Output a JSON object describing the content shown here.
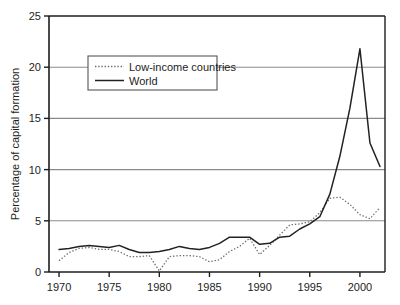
{
  "chart_data": {
    "type": "line",
    "title": "",
    "subtitle": "",
    "xlabel": "",
    "ylabel": "Percentage of capital formation",
    "xlim": [
      1969,
      2002.5
    ],
    "ylim": [
      0,
      25
    ],
    "yticks": [
      0,
      5,
      10,
      15,
      20,
      25
    ],
    "ytick_labels": [
      "0",
      "5",
      "10",
      "15",
      "20",
      "25"
    ],
    "xticks": [
      1970,
      1975,
      1980,
      1985,
      1990,
      1995,
      2000
    ],
    "xtick_labels": [
      "1970",
      "1975",
      "1980",
      "1985",
      "1990",
      "1995",
      "2000"
    ],
    "grid": "horizontal",
    "legend_position": "upper-left-inside",
    "series": [
      {
        "name": "Low-income countries",
        "style": "dotted",
        "color": "#6e6e6e",
        "x": [
          1970,
          1971,
          1972,
          1973,
          1974,
          1975,
          1976,
          1977,
          1978,
          1979,
          1980,
          1981,
          1982,
          1983,
          1984,
          1985,
          1986,
          1987,
          1988,
          1989,
          1990,
          1991,
          1992,
          1993,
          1994,
          1995,
          1996,
          1997,
          1998,
          1999,
          2000,
          2001,
          2002
        ],
        "values": [
          1.1,
          1.9,
          2.3,
          2.4,
          2.2,
          2.2,
          2.0,
          1.5,
          1.5,
          1.6,
          0.1,
          1.5,
          1.6,
          1.6,
          1.5,
          1.0,
          1.2,
          2.0,
          2.5,
          3.3,
          1.7,
          2.6,
          3.6,
          4.6,
          4.7,
          4.9,
          5.8,
          7.2,
          7.3,
          6.6,
          5.6,
          5.2,
          6.3
        ]
      },
      {
        "name": "World",
        "style": "solid",
        "color": "#222222",
        "x": [
          1970,
          1971,
          1972,
          1973,
          1974,
          1975,
          1976,
          1977,
          1978,
          1979,
          1980,
          1981,
          1982,
          1983,
          1984,
          1985,
          1986,
          1987,
          1988,
          1989,
          1990,
          1991,
          1992,
          1993,
          1994,
          1995,
          1996,
          1997,
          1998,
          1999,
          2000,
          2001,
          2002
        ],
        "values": [
          2.2,
          2.3,
          2.5,
          2.6,
          2.5,
          2.4,
          2.6,
          2.2,
          1.9,
          1.9,
          2.0,
          2.2,
          2.5,
          2.3,
          2.2,
          2.4,
          2.8,
          3.4,
          3.4,
          3.4,
          2.7,
          2.8,
          3.4,
          3.5,
          4.2,
          4.7,
          5.4,
          7.6,
          11.3,
          16.0,
          21.8,
          12.6,
          10.3
        ]
      }
    ],
    "annotations": []
  },
  "legend": {
    "entries": [
      {
        "label": "Low-income countries"
      },
      {
        "label": "World"
      }
    ]
  },
  "axis": {
    "y_title": "Percentage of capital formation"
  },
  "colors": {
    "axis": "#1d1d1d",
    "grid": "#8a8a8a",
    "world_line": "#222222",
    "lowincome_line": "#6e6e6e",
    "background": "#ffffff",
    "legend_border": "#555555"
  }
}
